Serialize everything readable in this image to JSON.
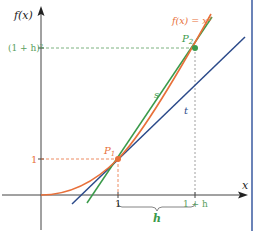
{
  "diagram": {
    "colors": {
      "curve": "#e8703a",
      "secant": "#3a9a4a",
      "tangent": "#2b4a8a",
      "axis": "#444444",
      "guide_orange": "#e8703a",
      "guide_green": "#5aa060",
      "border": "#3a5aa0"
    },
    "labels": {
      "y_axis": "f(x)",
      "x_axis": "x",
      "curve": "f(x) = x²",
      "secant": "s",
      "tangent": "t",
      "p1": "P",
      "p1_sub": "1",
      "p2": "P",
      "p2_sub": "2",
      "y_tick_1": "1",
      "y_tick_2": "(1 + h)²",
      "x_tick_1": "1",
      "x_tick_2": "1 + h",
      "brace": "h"
    },
    "points": {
      "origin": [
        0,
        0
      ],
      "p1": [
        1,
        1
      ],
      "p2": [
        "1+h",
        "(1+h)^2"
      ]
    }
  }
}
